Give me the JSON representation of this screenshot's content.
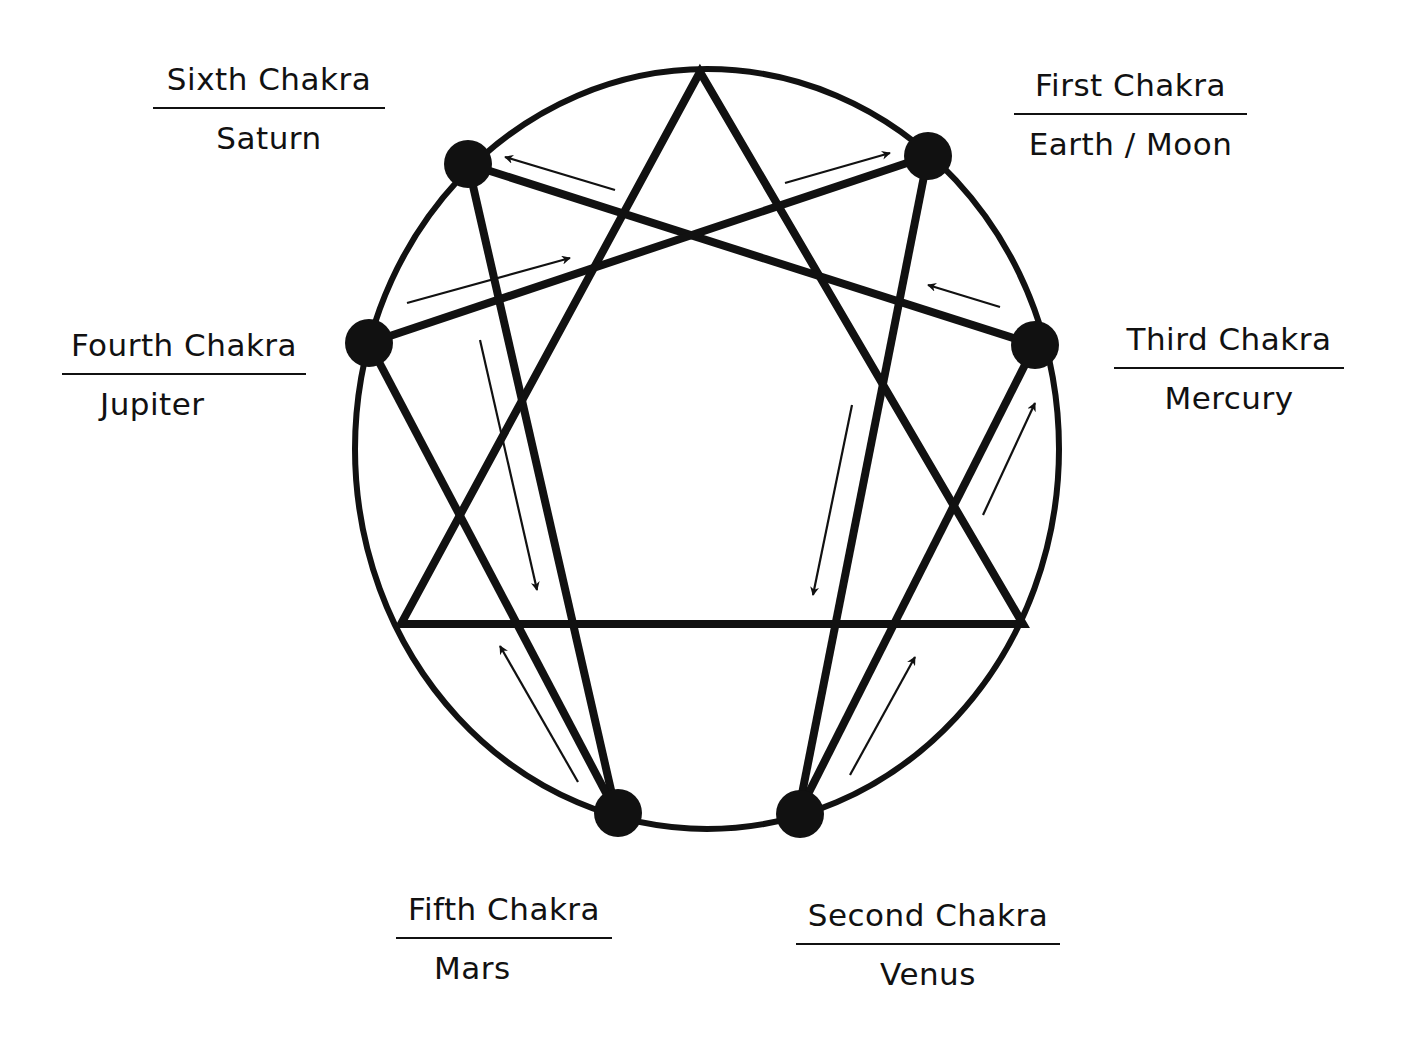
{
  "diagram": {
    "colors": {
      "ink": "#111111",
      "background": "#ffffff"
    },
    "circle": {
      "cx": 707,
      "cy": 449,
      "rx": 352,
      "ry": 380
    },
    "triangle": [
      [
        700,
        72
      ],
      [
        401,
        624
      ],
      [
        1023,
        624
      ]
    ],
    "nodes": [
      {
        "id": "sixth",
        "x": 468,
        "y": 164,
        "r": 24
      },
      {
        "id": "first",
        "x": 928,
        "y": 156,
        "r": 24
      },
      {
        "id": "fourth",
        "x": 369,
        "y": 343,
        "r": 24
      },
      {
        "id": "third",
        "x": 1035,
        "y": 345,
        "r": 24
      },
      {
        "id": "fifth",
        "x": 618,
        "y": 813,
        "r": 24
      },
      {
        "id": "second",
        "x": 800,
        "y": 814,
        "r": 24
      }
    ],
    "hexad_lines": [
      [
        468,
        164,
        1035,
        345
      ],
      [
        468,
        164,
        616,
        812
      ],
      [
        928,
        156,
        369,
        343
      ],
      [
        928,
        156,
        798,
        814
      ],
      [
        369,
        343,
        616,
        812
      ],
      [
        1035,
        345,
        798,
        814
      ]
    ],
    "arrows": [
      {
        "from": [
          615,
          190
        ],
        "to": [
          505,
          157
        ]
      },
      {
        "from": [
          785,
          183
        ],
        "to": [
          890,
          153
        ]
      },
      {
        "from": [
          407,
          303
        ],
        "to": [
          570,
          258
        ]
      },
      {
        "from": [
          1000,
          307
        ],
        "to": [
          928,
          285
        ]
      },
      {
        "from": [
          480,
          340
        ],
        "to": [
          537,
          590
        ]
      },
      {
        "from": [
          852,
          405
        ],
        "to": [
          813,
          595
        ]
      },
      {
        "from": [
          578,
          782
        ],
        "to": [
          500,
          646
        ]
      },
      {
        "from": [
          850,
          775
        ],
        "to": [
          915,
          657
        ]
      },
      {
        "from": [
          983,
          515
        ],
        "to": [
          1035,
          403
        ]
      }
    ]
  },
  "labels": {
    "sixth": {
      "chakra": "Sixth Chakra",
      "planet": "Saturn"
    },
    "first": {
      "chakra": "First Chakra",
      "planet": "Earth / Moon"
    },
    "fourth": {
      "chakra": "Fourth Chakra",
      "planet": "Jupiter"
    },
    "third": {
      "chakra": "Third Chakra",
      "planet": "Mercury"
    },
    "fifth": {
      "chakra": "Fifth Chakra",
      "planet": "Mars"
    },
    "second": {
      "chakra": "Second Chakra",
      "planet": "Venus"
    }
  }
}
